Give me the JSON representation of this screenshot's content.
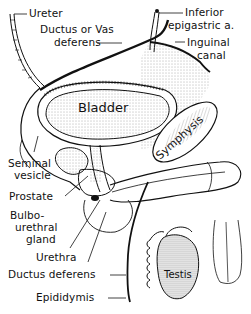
{
  "diagram": {
    "type": "anatomical illustration",
    "colors": {
      "ink": "#111111",
      "background": "#ffffff",
      "stipple": "#555555"
    },
    "organ_labels": {
      "bladder": "Bladder",
      "symphysis": "Symphysis",
      "testis": "Testis"
    },
    "callouts": {
      "ureter": "Ureter",
      "ductus_vas_line1": "Ductus or Vas",
      "ductus_vas_line2": "deferens",
      "inferior_epigastric_line1": "Inferior",
      "inferior_epigastric_line2": "epigastric a.",
      "inguinal_line1": "Inguinal",
      "inguinal_line2": "canal",
      "seminal_line1": "Seminal",
      "seminal_line2": "vesicle",
      "prostate": "Prostate",
      "bulbo_line1": "Bulbo-",
      "bulbo_line2": "urethral",
      "bulbo_line3": "gland",
      "urethra": "Urethra",
      "ductus_deferens": "Ductus deferens",
      "epididymis": "Epididymis"
    }
  }
}
